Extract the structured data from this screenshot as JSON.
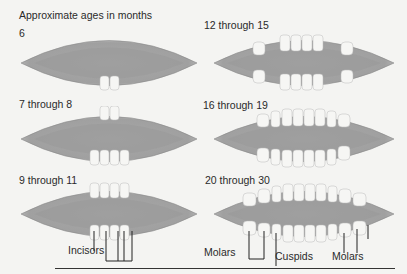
{
  "title": "Approximate ages in months",
  "panels": [
    {
      "age": "6",
      "upper_teeth": 0,
      "lower_teeth": 2
    },
    {
      "age": "12 through 15",
      "upper_teeth": 6,
      "lower_teeth": 6
    },
    {
      "age": "7 through 8",
      "upper_teeth": 2,
      "lower_teeth": 4
    },
    {
      "age": "16 through 19",
      "upper_teeth": 8,
      "lower_teeth": 8
    },
    {
      "age": "9 through 11",
      "upper_teeth": 4,
      "lower_teeth": 4
    },
    {
      "age": "20 through 30",
      "upper_teeth": 10,
      "lower_teeth": 10
    }
  ],
  "labels": {
    "incisors": "Incisors",
    "molars_left": "Molars",
    "cuspids": "Cuspids",
    "molars_right": "Molars"
  },
  "colors": {
    "gum_outer": "#c8c8c8",
    "gum_inner": "#9e9e9e",
    "tooth": "#f6f6f4",
    "text": "#2a2a2a",
    "background": "#f4f4f2"
  }
}
